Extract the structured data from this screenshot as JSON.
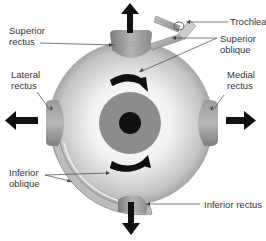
{
  "diagram": {
    "labels": {
      "superior_rectus": "Superior\nrectus",
      "trochlea": "Trochlea",
      "superior_oblique": "Superior\noblique",
      "lateral_rectus": "Lateral\nrectus",
      "medial_rectus": "Medial\nrectus",
      "inferior_oblique": "Inferior\noblique",
      "inferior_rectus": "Inferior rectus"
    },
    "arrows": {
      "up": "pull-up-arrow",
      "down": "pull-down-arrow",
      "left": "pull-left-arrow",
      "right": "pull-right-arrow",
      "rotation_top": "clockwise-rotation-arrow",
      "rotation_bottom": "counterclockwise-rotation-arrow"
    },
    "colors": {
      "eyeball_light": "#f4f4f4",
      "eyeball_dark": "#8a8a8a",
      "iris": "#8c8c8c",
      "pupil": "#111111",
      "muscle": "#9a9a9a",
      "arrow": "#111111",
      "leader_line": "#444444",
      "text": "#333333"
    }
  }
}
